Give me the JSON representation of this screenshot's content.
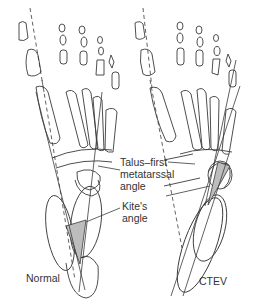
{
  "figure": {
    "labels": {
      "talus_first_metatarsal_line1": "Talus–first",
      "talus_first_metatarsal_line2": "metatarssal",
      "talus_first_metatarsal_line3": "angle",
      "kites_line1": "Kite's",
      "kites_line2": "angle",
      "normal": "Normal",
      "ctev": "CTEV"
    },
    "panels": [
      "Normal",
      "CTEV"
    ],
    "colors": {
      "stroke": "#3a3a3a",
      "shaded_angle": "#bdbdbd",
      "background": "#ffffff"
    }
  }
}
